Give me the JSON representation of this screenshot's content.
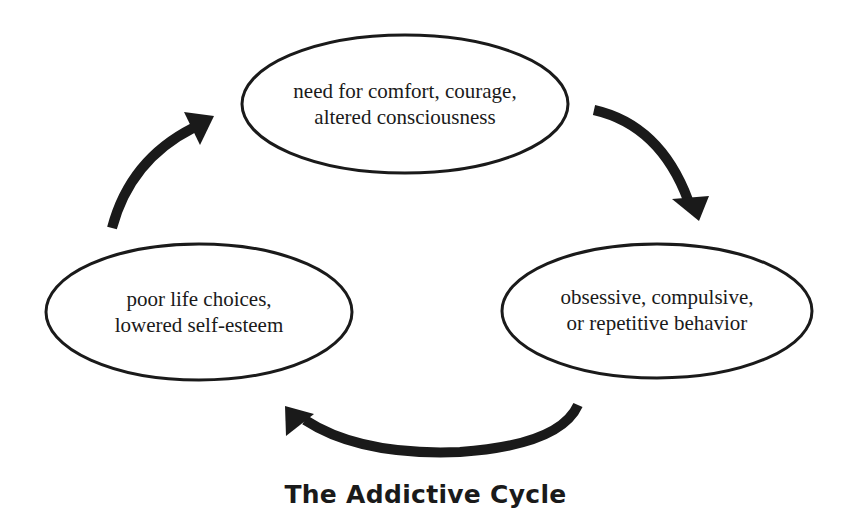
{
  "diagram": {
    "title": "The Addictive Cycle",
    "stroke_color": "#1a1a1a",
    "background": "#ffffff",
    "nodes": [
      {
        "id": "need",
        "lines": [
          "need for comfort, courage,",
          "altered consciousness"
        ],
        "shape": "ellipse",
        "cx": 405,
        "cy": 104,
        "rx": 163,
        "ry": 69
      },
      {
        "id": "behavior",
        "lines": [
          "obsessive, compulsive,",
          "or repetitive behavior"
        ],
        "shape": "ellipse",
        "cx": 657,
        "cy": 311,
        "rx": 155,
        "ry": 67
      },
      {
        "id": "consequences",
        "lines": [
          "poor life choices,",
          "lowered self-esteem"
        ],
        "shape": "ellipse",
        "cx": 199,
        "cy": 312,
        "rx": 153,
        "ry": 68
      }
    ],
    "edges": [
      {
        "from": "need",
        "to": "behavior",
        "style": "curved-arrow"
      },
      {
        "from": "behavior",
        "to": "consequences",
        "style": "curved-arrow"
      },
      {
        "from": "consequences",
        "to": "need",
        "style": "curved-arrow"
      }
    ]
  }
}
